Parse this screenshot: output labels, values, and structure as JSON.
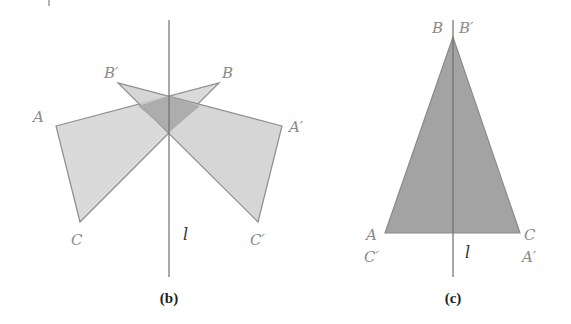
{
  "figure_b": {
    "caption": "(b)",
    "axis_label": "l",
    "labels": {
      "A": "A",
      "B": "B",
      "C": "C",
      "A_prime": "A′",
      "B_prime": "B′",
      "C_prime": "C′"
    }
  },
  "figure_c": {
    "caption": "(c)",
    "axis_label": "l",
    "labels": {
      "B": "B",
      "B_prime": "B′",
      "A": "A",
      "C_prime": "C′",
      "C": "C",
      "A_prime": "A′"
    }
  },
  "colors": {
    "fill_light": "#d4d4d4",
    "fill_overlap": "#a9a9a9",
    "fill_triangle_c": "#a0a0a0",
    "edge": "#8c8c8c",
    "axis": "#707070",
    "label": "#8a8a8a"
  }
}
